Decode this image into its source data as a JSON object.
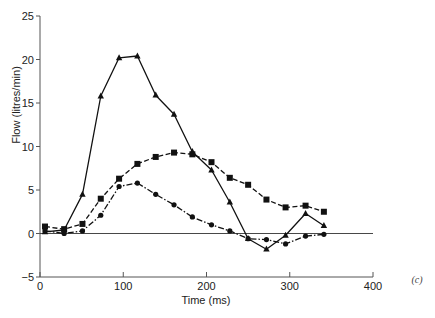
{
  "chart_data": {
    "type": "line",
    "title": "",
    "panel_label": "(c)",
    "xlabel": "Time (ms)",
    "ylabel": "Flow (litres/min)",
    "xlim": [
      0,
      400
    ],
    "ylim": [
      -5,
      25
    ],
    "x_ticks": [
      0,
      100,
      200,
      300,
      400
    ],
    "y_ticks": [
      -5,
      0,
      5,
      10,
      15,
      20,
      25
    ],
    "grid": false,
    "reference_line": {
      "y": 0,
      "x_range": [
        0,
        400
      ]
    },
    "legend": null,
    "x": [
      6,
      29,
      51,
      73,
      95,
      117,
      139,
      161,
      183,
      206,
      228,
      250,
      272,
      295,
      319,
      341
    ],
    "series": [
      {
        "name": "triangles",
        "marker": "triangle",
        "line_style": "solid",
        "values": [
          0.2,
          0.4,
          4.5,
          15.8,
          20.2,
          20.4,
          15.9,
          13.7,
          9.4,
          7.3,
          3.6,
          -0.6,
          -1.8,
          -0.2,
          2.3,
          0.9
        ]
      },
      {
        "name": "squares",
        "marker": "square",
        "line_style": "dashed",
        "values": [
          0.8,
          0.5,
          1.1,
          4.0,
          6.3,
          8.0,
          8.8,
          9.3,
          9.1,
          8.2,
          6.4,
          5.6,
          3.9,
          3.0,
          3.2,
          2.5
        ]
      },
      {
        "name": "circles",
        "marker": "circle",
        "line_style": "dash-dot",
        "values": [
          0.3,
          0.0,
          0.3,
          2.1,
          5.4,
          5.8,
          4.5,
          3.3,
          1.9,
          1.0,
          0.3,
          -0.6,
          -0.7,
          -1.2,
          -0.3,
          -0.1
        ]
      }
    ]
  },
  "colors": {
    "ink": "#111111",
    "axis": "#555555"
  }
}
